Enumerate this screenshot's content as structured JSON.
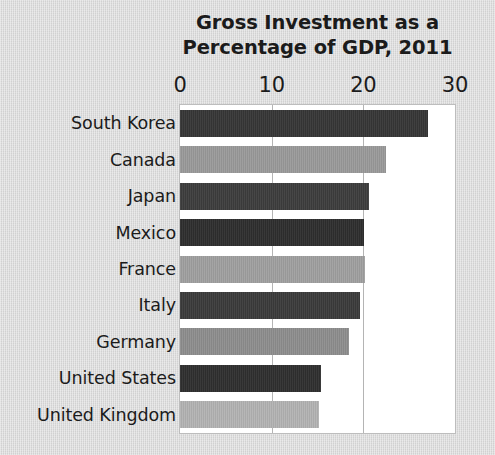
{
  "chart_data": {
    "type": "bar",
    "orientation": "horizontal",
    "title": "Gross Investment as a\nPercentage of GDP, 2011",
    "title_line1": "Gross Investment as a",
    "title_line2": "Percentage of GDP, 2011",
    "xlabel": "",
    "ylabel": "",
    "xlim": [
      0,
      30
    ],
    "xticks": [
      0,
      10,
      20,
      30
    ],
    "xtick_labels": [
      "0",
      "10",
      "20",
      "30"
    ],
    "grid": "vertical-only",
    "legend": "none",
    "axis_position": "top",
    "categories": [
      "South Korea",
      "Canada",
      "Japan",
      "Mexico",
      "France",
      "Italy",
      "Germany",
      "United States",
      "United Kingdom"
    ],
    "values": [
      27.1,
      22.5,
      20.6,
      20.1,
      20.2,
      19.6,
      18.4,
      15.4,
      15.2
    ],
    "bar_colors": [
      "#363636",
      "#9a9a9a",
      "#3d3d3d",
      "#2e2e2e",
      "#a0a0a0",
      "#3b3b3b",
      "#8e8e8e",
      "#2f2f2f",
      "#b3b3b3"
    ],
    "bars": [
      {
        "category": "South Korea",
        "value": 27.1,
        "color": "#363636"
      },
      {
        "category": "Canada",
        "value": 22.5,
        "color": "#9a9a9a"
      },
      {
        "category": "Japan",
        "value": 20.6,
        "color": "#3d3d3d"
      },
      {
        "category": "Mexico",
        "value": 20.1,
        "color": "#2e2e2e"
      },
      {
        "category": "France",
        "value": 20.2,
        "color": "#a0a0a0"
      },
      {
        "category": "Italy",
        "value": 19.6,
        "color": "#3b3b3b"
      },
      {
        "category": "Germany",
        "value": 18.4,
        "color": "#8e8e8e"
      },
      {
        "category": "United States",
        "value": 15.4,
        "color": "#2f2f2f"
      },
      {
        "category": "United Kingdom",
        "value": 15.2,
        "color": "#b3b3b3"
      }
    ]
  },
  "colors": {
    "page_background": "#d9d9d9",
    "plot_background": "#ffffff",
    "text": "#1b1b1b",
    "gridline": "#b4b4b4",
    "plot_border": "#bdbdbd"
  }
}
